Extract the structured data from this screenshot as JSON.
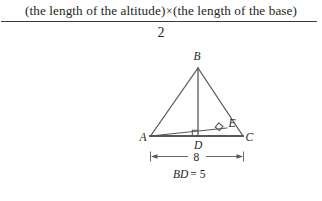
{
  "formula": {
    "numerator_part1": "(the length of the altitude)",
    "times_symbol": "×",
    "numerator_part2": "(the length of the base)",
    "denominator": "2"
  },
  "diagram": {
    "vertices": {
      "A": "A",
      "B": "B",
      "C": "C",
      "D": "D",
      "E": "E"
    },
    "dimension_base": "8",
    "altitude_note": "BD = 5",
    "altitude_note_italic": "BD",
    "altitude_note_rest": "= 5",
    "stroke_color": "#58585b",
    "text_color": "#231f20"
  }
}
